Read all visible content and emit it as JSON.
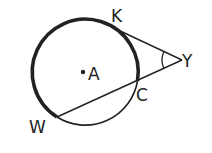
{
  "diagram": {
    "type": "geometry",
    "colors": {
      "stroke": "#222222",
      "background": "#ffffff"
    },
    "circle": {
      "center_label": "A",
      "cx": 85,
      "cy": 72,
      "r": 53
    },
    "points": {
      "K": {
        "label": "K",
        "x": 116,
        "y": 28
      },
      "Y": {
        "label": "Y",
        "x": 182,
        "y": 60
      },
      "C": {
        "label": "C",
        "x": 137,
        "y": 81
      },
      "W": {
        "label": "W",
        "x": 57,
        "y": 117
      },
      "A": {
        "label": "A",
        "x": 83,
        "y": 73
      }
    },
    "segments": [
      {
        "name": "tangent-KY",
        "from": "K",
        "to": "Y"
      },
      {
        "name": "secant-WY",
        "from": "W",
        "to": "Y"
      }
    ],
    "arcs": [
      {
        "name": "major-arc-WKC",
        "emphasis": "bold"
      },
      {
        "name": "minor-arc-WC",
        "emphasis": "normal"
      }
    ],
    "angle_mark": {
      "vertex": "Y"
    }
  }
}
